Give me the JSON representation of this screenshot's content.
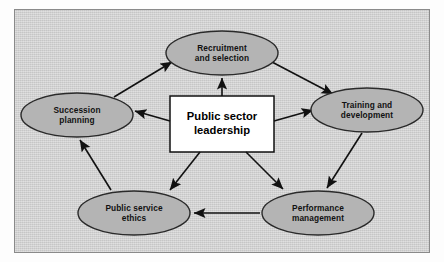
{
  "figure": {
    "kind": "cycle-diagram",
    "center": {
      "label": "Public sector\nleadership",
      "shape": "rectangle",
      "fill": "#ffffff",
      "stroke": "#111111"
    },
    "node_fill": "#b4b4b4",
    "node_stroke": "#2a2a2a",
    "panel_bg": "#d0d0d0",
    "arrow_color": "#111111",
    "nodes": [
      {
        "id": "recruitment",
        "label": "Recruitment\nand selection",
        "shape": "ellipse",
        "cx": 222,
        "cy": 53,
        "rx": 56,
        "ry": 22
      },
      {
        "id": "training",
        "label": "Training and\ndevelopment",
        "shape": "ellipse",
        "cx": 367,
        "cy": 110,
        "rx": 56,
        "ry": 22
      },
      {
        "id": "performance",
        "label": "Performance\nmanagement",
        "shape": "ellipse",
        "cx": 318,
        "cy": 213,
        "rx": 56,
        "ry": 22
      },
      {
        "id": "ethics",
        "label": "Public service\nethics",
        "shape": "ellipse",
        "cx": 134,
        "cy": 213,
        "rx": 56,
        "ry": 22
      },
      {
        "id": "succession",
        "label": "Succession\nplanning",
        "shape": "ellipse",
        "cx": 77,
        "cy": 115,
        "rx": 56,
        "ry": 22
      }
    ],
    "edges": [
      {
        "from": "succession",
        "to": "recruitment",
        "type": "cycle"
      },
      {
        "from": "recruitment",
        "to": "training",
        "type": "cycle"
      },
      {
        "from": "training",
        "to": "performance",
        "type": "cycle"
      },
      {
        "from": "performance",
        "to": "ethics",
        "type": "cycle"
      },
      {
        "from": "ethics",
        "to": "succession",
        "type": "cycle"
      },
      {
        "from": "center",
        "to": "recruitment",
        "type": "radial"
      },
      {
        "from": "center",
        "to": "training",
        "type": "radial"
      },
      {
        "from": "center",
        "to": "performance",
        "type": "radial"
      },
      {
        "from": "center",
        "to": "ethics",
        "type": "radial"
      },
      {
        "from": "center",
        "to": "succession",
        "type": "radial"
      }
    ]
  }
}
